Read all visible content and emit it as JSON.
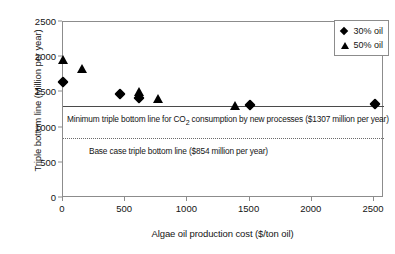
{
  "chart_data": {
    "type": "scatter",
    "title": "",
    "xlabel": "Algae oil production cost ($/ton oil)",
    "ylabel": "Triple bottom line (Million per year)",
    "xlim": [
      0,
      2580
    ],
    "ylim": [
      0,
      2500
    ],
    "xticks": [
      0,
      500,
      1000,
      1500,
      2000,
      2500
    ],
    "yticks": [
      0,
      500,
      1000,
      1500,
      2000,
      2500
    ],
    "xtick_labels": [
      "0",
      "500",
      "1000",
      "1500",
      "2000",
      "2500"
    ],
    "ytick_labels": [
      "0",
      "500",
      "1000",
      "1500",
      "2000",
      "2500"
    ],
    "grid": false,
    "legend_position": "top-right",
    "series": [
      {
        "name": "30% oil",
        "marker": "diamond",
        "color": "#000000",
        "points": [
          {
            "x": 0,
            "y": 1650
          },
          {
            "x": 460,
            "y": 1480
          },
          {
            "x": 610,
            "y": 1415
          },
          {
            "x": 1500,
            "y": 1320
          },
          {
            "x": 2510,
            "y": 1335
          }
        ]
      },
      {
        "name": "50% oil",
        "marker": "triangle",
        "color": "#000000",
        "points": [
          {
            "x": 0,
            "y": 1970
          },
          {
            "x": 155,
            "y": 1845
          },
          {
            "x": 610,
            "y": 1510
          },
          {
            "x": 765,
            "y": 1420
          },
          {
            "x": 1380,
            "y": 1310
          }
        ]
      }
    ],
    "reference_lines": [
      {
        "name": "minimum-triple-bottom-line",
        "value": 1307,
        "style": "solid",
        "label": "Minimum triple bottom line for CO2 consumption by new processes ($1307 million per year)",
        "label_prefix": "Minimum triple bottom line for CO",
        "label_subscript": "2",
        "label_suffix": " consumption by new processes ($1307 million per year)"
      },
      {
        "name": "base-case-triple-bottom-line",
        "value": 854,
        "style": "dotted",
        "label": "Base case triple bottom line ($854 million per year)"
      }
    ],
    "legend": [
      {
        "label": "30% oil",
        "marker": "diamond"
      },
      {
        "label": "50% oil",
        "marker": "triangle"
      }
    ]
  }
}
